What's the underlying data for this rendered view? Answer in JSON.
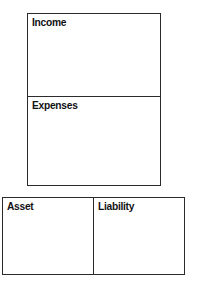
{
  "diagram": {
    "background_color": "#ffffff",
    "border_color": "#2b2b2e",
    "text_color": "#111114",
    "statement_block": {
      "name": "income-statement",
      "rows": [
        {
          "label": "Income",
          "content": ""
        },
        {
          "label": "Expenses",
          "content": ""
        }
      ]
    },
    "balance_block": {
      "name": "balance-sheet",
      "cells": [
        {
          "label": "Asset",
          "content": ""
        },
        {
          "label": "Liability",
          "content": ""
        }
      ]
    }
  }
}
